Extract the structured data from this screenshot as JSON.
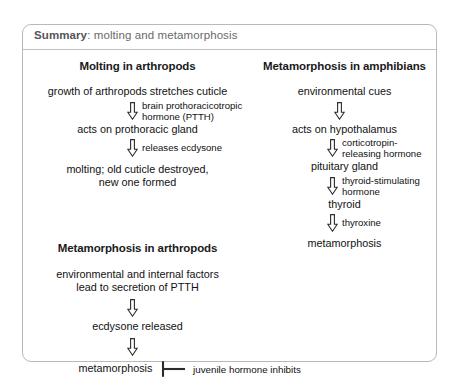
{
  "header": {
    "strong": "Summary",
    "rest": ": molting and metamorphosis"
  },
  "icons": {
    "down_arrow": "down-arrow-icon",
    "inhibit": "inhibition-bar-icon"
  },
  "colors": {
    "box_border": "#b9b9b9",
    "header_rule": "#c2c2c2",
    "header_text": "#5d5d5d",
    "body_text": "#111111",
    "page_bg": "#ffffff"
  },
  "sections": {
    "molting_arthropods": {
      "title": "Molting in arthropods",
      "nodes": [
        "growth of arthropods stretches cuticle",
        "acts on prothoracic gland",
        "molting; old cuticle destroyed,\nnew one formed"
      ],
      "node3_line1": "molting; old cuticle destroyed,",
      "node3_line2": "new one formed",
      "arrows": [
        {
          "label_line1": "brain prothoracicotropic",
          "label_line2": "hormone (PTTH)"
        },
        {
          "label_line1": "releases ecdysone",
          "label_line2": ""
        }
      ]
    },
    "metamorphosis_arthropods": {
      "title": "Metamorphosis in arthropods",
      "node1_line1": "environmental and internal factors",
      "node1_line2": "lead to secretion of PTTH",
      "node2": "ecdysone released",
      "node3": "metamorphosis",
      "arrows": [
        {
          "label_line1": "",
          "label_line2": ""
        },
        {
          "label_line1": "",
          "label_line2": ""
        }
      ],
      "inhibitor_label": "juvenile hormone inhibits"
    },
    "metamorphosis_amphibians": {
      "title": "Metamorphosis in amphibians",
      "nodes": [
        "environmental cues",
        "acts on hypothalamus",
        "pituitary gland",
        "thyroid",
        "metamorphosis"
      ],
      "arrows": [
        {
          "label_line1": "",
          "label_line2": ""
        },
        {
          "label_line1": "corticotropin-",
          "label_line2": "releasing hormone"
        },
        {
          "label_line1": "thyroid-stimulating",
          "label_line2": "hormone"
        },
        {
          "label_line1": "thyroxine",
          "label_line2": ""
        }
      ]
    }
  }
}
